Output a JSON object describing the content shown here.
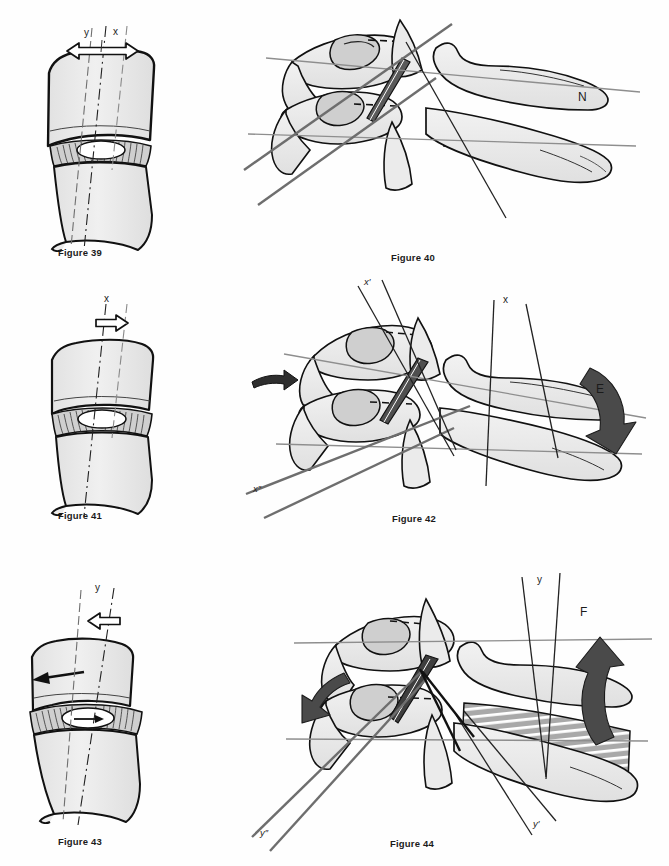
{
  "plate": {
    "title": "Cervical spine biomechanics figure plate",
    "background_color": "#ffffff",
    "ink_color": "#1b1b1b",
    "bone_fill": "#ededed",
    "bone_fill_dark": "#d2d2d2",
    "arrow_dark_fill": "#4a4a4a",
    "arrow_black_fill": "#1b1b1b",
    "guide_line_color": "#8c8c8c",
    "axis_line_color": "#2b2b2b"
  },
  "figures": [
    {
      "id": "figure-39",
      "caption": "Figure 39",
      "column": "left",
      "row": 1,
      "subject": "vertebral motion segment with intervertebral disc",
      "view": "oblique anterior",
      "axis_labels": [
        {
          "name": "axis-label-y",
          "text": "y"
        },
        {
          "name": "axis-label-x",
          "text": "x"
        }
      ],
      "arrows": [
        {
          "name": "double-headed-translation-arrow",
          "style": "hollow",
          "direction": "bidirectional-horizontal"
        }
      ],
      "axis_lines": [
        "y-dash-dot-axis",
        "center-dash-dot-axis",
        "x-dashed-axis"
      ],
      "disc_features": [
        "annulus-fibrosus-lamellae",
        "nucleus-pulposus"
      ]
    },
    {
      "id": "figure-40",
      "caption": "Figure 40",
      "column": "right",
      "row": 1,
      "subject": "upper cervical vertebrae C1-C2 lateral oblique",
      "state_label": {
        "name": "neutral-state-label",
        "text": "N",
        "meaning": "neutral"
      },
      "axis_labels": [],
      "arrows": [],
      "guide_lines": [
        "upper-horizontal-reference",
        "lower-horizontal-reference",
        "upper-oblique-reference",
        "lower-oblique-reference"
      ],
      "disc_features": [
        "striated-disc-band"
      ]
    },
    {
      "id": "figure-41",
      "caption": "Figure 41",
      "column": "left",
      "row": 2,
      "subject": "vertebral motion segment with intervertebral disc",
      "view": "oblique anterior",
      "axis_labels": [
        {
          "name": "axis-label-x",
          "text": "x"
        }
      ],
      "arrows": [
        {
          "name": "translation-arrow-right",
          "style": "hollow",
          "direction": "right"
        }
      ],
      "axis_lines": [
        "center-dash-dot-axis",
        "x-dashed-axis"
      ],
      "disc_features": [
        "annulus-fibrosus-lamellae",
        "nucleus-pulposus"
      ]
    },
    {
      "id": "figure-42",
      "caption": "Figure 42",
      "column": "right",
      "row": 2,
      "subject": "upper cervical vertebrae C1-C2 lateral oblique",
      "state_label": {
        "name": "extension-state-label",
        "text": "E",
        "meaning": "extension"
      },
      "axis_labels": [
        {
          "name": "axis-label-x-prime",
          "text": "x′"
        },
        {
          "name": "axis-label-x",
          "text": "x"
        },
        {
          "name": "axis-label-x-double-prime",
          "text": "x″"
        }
      ],
      "arrows": [
        {
          "name": "extension-curved-arrow",
          "style": "solid-dark",
          "direction": "down-left-curve"
        },
        {
          "name": "anterior-translation-arrow",
          "style": "solid-dark",
          "direction": "right"
        }
      ],
      "guide_lines": [
        "upper-horizontal-reference",
        "lower-horizontal-reference",
        "upper-oblique-reference",
        "lower-oblique-reference"
      ],
      "disc_features": [
        "striated-disc-band"
      ]
    },
    {
      "id": "figure-43",
      "caption": "Figure 43",
      "column": "left",
      "row": 3,
      "subject": "vertebral motion segment with intervertebral disc",
      "view": "oblique anterior",
      "axis_labels": [
        {
          "name": "axis-label-y",
          "text": "y"
        }
      ],
      "arrows": [
        {
          "name": "translation-arrow-left",
          "style": "hollow",
          "direction": "left"
        },
        {
          "name": "vertebral-shear-arrow",
          "style": "solid-black",
          "direction": "left"
        },
        {
          "name": "nucleus-shift-arrow",
          "style": "solid-black",
          "direction": "right"
        }
      ],
      "axis_lines": [
        "y-dash-dot-axis",
        "center-dash-dot-axis"
      ],
      "disc_features": [
        "annulus-fibrosus-lamellae",
        "nucleus-pulposus"
      ]
    },
    {
      "id": "figure-44",
      "caption": "Figure 44",
      "column": "right",
      "row": 3,
      "subject": "upper cervical vertebrae C1-C2 lateral oblique",
      "state_label": {
        "name": "flexion-state-label",
        "text": "F",
        "meaning": "flexion"
      },
      "axis_labels": [
        {
          "name": "axis-label-y",
          "text": "y"
        },
        {
          "name": "axis-label-y-prime",
          "text": "y′"
        },
        {
          "name": "axis-label-y-double-prime",
          "text": "y″"
        }
      ],
      "arrows": [
        {
          "name": "flexion-curved-arrow",
          "style": "solid-dark",
          "direction": "up-curve"
        },
        {
          "name": "posterior-translation-arrow",
          "style": "solid-dark",
          "direction": "down-left"
        }
      ],
      "guide_lines": [
        "upper-horizontal-reference",
        "lower-horizontal-reference",
        "upper-oblique-reference",
        "lower-oblique-reference"
      ],
      "disc_features": [
        "striated-disc-band"
      ]
    }
  ]
}
